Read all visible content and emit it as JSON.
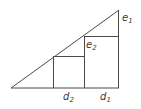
{
  "figure": {
    "type": "geometry-diagram",
    "background_color": "#ffffff",
    "stroke_color": "#4a4a4a",
    "label_color": "#3a3a3a",
    "stroke_width": 1,
    "labels": [
      {
        "id": "e1",
        "base": "e",
        "sub": "1",
        "x": 122,
        "y": 13
      },
      {
        "id": "e2",
        "base": "e",
        "sub": "2",
        "x": 86,
        "y": 40
      },
      {
        "id": "d2",
        "base": "d",
        "sub": "2",
        "x": 63,
        "y": 92
      },
      {
        "id": "d1",
        "base": "d",
        "sub": "1",
        "x": 100,
        "y": 92
      }
    ],
    "geometry": {
      "triangle": {
        "left_vertex": {
          "x": 11,
          "y": 88
        },
        "right_vertex": {
          "x": 119,
          "y": 88
        },
        "apex": {
          "x": 119,
          "y": 10
        }
      },
      "baseline": {
        "x1": 11,
        "y1": 88,
        "x2": 119,
        "y2": 88
      },
      "right_leg": {
        "x1": 119,
        "y1": 88,
        "x2": 119,
        "y2": 10
      },
      "hypotenuse": {
        "x1": 11,
        "y1": 88,
        "x2": 119,
        "y2": 10
      },
      "square_large": {
        "left": 84,
        "right": 119,
        "top": 36,
        "bottom": 88
      },
      "square_small": {
        "left": 53,
        "right": 84,
        "top": 56,
        "bottom": 88
      }
    }
  }
}
